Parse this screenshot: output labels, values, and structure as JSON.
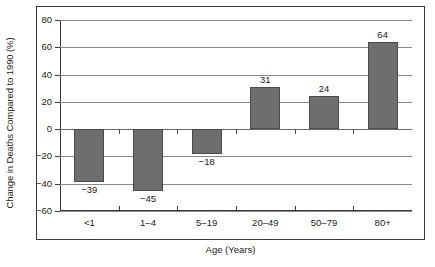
{
  "chart_data": {
    "type": "bar",
    "title": "",
    "xlabel": "Age (Years)",
    "ylabel": "Change in Deaths Compared to 1990 (%)",
    "categories": [
      "<1",
      "1–4",
      "5–19",
      "20–49",
      "50–79",
      "80+"
    ],
    "values": [
      -39,
      -45,
      -18,
      31,
      24,
      64
    ],
    "data_labels": [
      "−39",
      "−45",
      "−18",
      "31",
      "24",
      "64"
    ],
    "ylim": [
      -60,
      80
    ],
    "yticks": [
      80,
      60,
      40,
      20,
      0,
      -20,
      -40,
      -60
    ],
    "ytick_labels": [
      "80",
      "60",
      "40",
      "20",
      "0",
      "−20",
      "−40",
      "−60"
    ],
    "grid": true,
    "grid_axis": "y",
    "legend": "none",
    "bar_color": "#6e6e6e",
    "bar_edge_color": "#4a4a4a",
    "axis_color": "#3a3a3a",
    "grid_color": "#8a8a8a",
    "background_color": "#ffffff"
  }
}
